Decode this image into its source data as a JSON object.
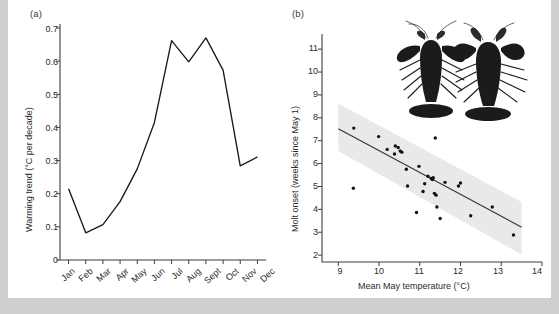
{
  "figure": {
    "panel_a_label": "(a)",
    "panel_b_label": "(b)"
  },
  "chart_data": [
    {
      "type": "line",
      "panel": "(a)",
      "title": "",
      "xlabel": "",
      "ylabel": "Warming trend (°C per decade)",
      "categories": [
        "Jan",
        "Feb",
        "Mar",
        "Apr",
        "May",
        "Jun",
        "Jul",
        "Aug",
        "Sept",
        "Oct",
        "Nov",
        "Dec"
      ],
      "values": [
        0.215,
        0.082,
        0.107,
        0.176,
        0.275,
        0.415,
        0.662,
        0.598,
        0.67,
        0.573,
        0.284,
        0.311
      ],
      "ylim": [
        0,
        0.7
      ],
      "yticks": [
        "0",
        "0.1",
        "0.2",
        "0.3",
        "0.4",
        "0.5",
        "0.6",
        "0.7"
      ],
      "ytick_values": [
        0,
        0.1,
        0.2,
        0.3,
        0.4,
        0.5,
        0.6,
        0.7
      ],
      "grid": false,
      "legend": "none"
    },
    {
      "type": "scatter",
      "panel": "(b)",
      "title": "",
      "xlabel": "Mean May temperature (°C)",
      "ylabel": "Molt onset (weeks since May 1)",
      "xlim": [
        8.6,
        14
      ],
      "ylim": [
        1.7,
        11.4
      ],
      "xticks": [
        "9",
        "10",
        "11",
        "12",
        "13",
        "14"
      ],
      "xtick_values": [
        9,
        10,
        11,
        12,
        13,
        14
      ],
      "yticks": [
        "2",
        "3",
        "4",
        "5",
        "6",
        "7",
        "8",
        "9",
        "10",
        "11"
      ],
      "ytick_values": [
        2,
        3,
        4,
        5,
        6,
        7,
        8,
        9,
        10,
        11
      ],
      "grid": false,
      "legend": "none",
      "points": [
        [
          9.38,
          7.55
        ],
        [
          9.37,
          4.92
        ],
        [
          9.99,
          7.18
        ],
        [
          10.2,
          6.62
        ],
        [
          10.38,
          6.42
        ],
        [
          10.4,
          6.77
        ],
        [
          10.47,
          6.7
        ],
        [
          10.52,
          6.55
        ],
        [
          10.56,
          6.5
        ],
        [
          10.67,
          5.75
        ],
        [
          10.7,
          5.02
        ],
        [
          10.92,
          3.86
        ],
        [
          10.98,
          5.88
        ],
        [
          11.08,
          4.78
        ],
        [
          11.12,
          5.12
        ],
        [
          11.2,
          5.45
        ],
        [
          11.28,
          5.35
        ],
        [
          11.31,
          5.3
        ],
        [
          11.33,
          5.38
        ],
        [
          11.36,
          4.7
        ],
        [
          11.38,
          7.12
        ],
        [
          11.4,
          4.62
        ],
        [
          11.42,
          4.1
        ],
        [
          11.5,
          3.6
        ],
        [
          11.62,
          5.18
        ],
        [
          11.95,
          5.02
        ],
        [
          12.0,
          5.15
        ],
        [
          12.25,
          3.72
        ],
        [
          12.78,
          4.1
        ],
        [
          13.3,
          2.88
        ]
      ],
      "regression": {
        "x_start": 9.0,
        "y_start": 7.52,
        "x_end": 13.5,
        "y_end": 3.22
      },
      "ci_band": {
        "x_start": 9.0,
        "x_end": 13.5,
        "upper_start": 8.62,
        "upper_end": 4.32,
        "lower_start": 6.55,
        "lower_end": 2.02
      },
      "inset": {
        "name": "lobster-photo",
        "description": "two dark lobsters"
      }
    }
  ]
}
